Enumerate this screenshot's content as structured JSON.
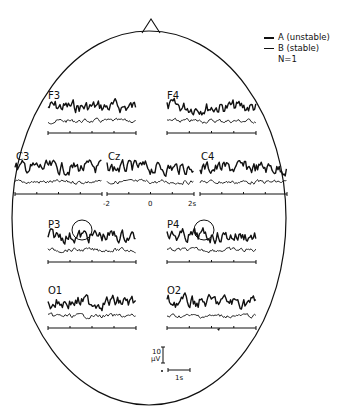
{
  "legend": {
    "series_a": "A (unstable)",
    "series_b": "B (stable)",
    "n_label": "N=1"
  },
  "electrodes": [
    {
      "id": "F3",
      "label": "F3",
      "x": 48,
      "y": 91,
      "trace_x0": 48,
      "trace_x1": 136,
      "has_circle": false
    },
    {
      "id": "F4",
      "label": "F4",
      "x": 167,
      "y": 91,
      "trace_x0": 167,
      "trace_x1": 256,
      "has_circle": false
    },
    {
      "id": "C3",
      "label": "C3",
      "x": 16,
      "y": 152,
      "trace_x0": 15,
      "trace_x1": 102,
      "has_circle": false
    },
    {
      "id": "Cz",
      "label": "Cz",
      "x": 108,
      "y": 152,
      "trace_x0": 107,
      "trace_x1": 194,
      "has_circle": false
    },
    {
      "id": "C4",
      "label": "C4",
      "x": 201,
      "y": 152,
      "trace_x0": 200,
      "trace_x1": 287,
      "has_circle": false
    },
    {
      "id": "P3",
      "label": "P3",
      "x": 48,
      "y": 220,
      "trace_x0": 48,
      "trace_x1": 136,
      "has_circle": true,
      "circle_cx": 82,
      "circle_cy": 230
    },
    {
      "id": "P4",
      "label": "P4",
      "x": 167,
      "y": 220,
      "trace_x0": 167,
      "trace_x1": 256,
      "has_circle": true,
      "circle_cx": 204,
      "circle_cy": 230
    },
    {
      "id": "O1",
      "label": "O1",
      "x": 48,
      "y": 286,
      "trace_x0": 48,
      "trace_x1": 136,
      "has_circle": false
    },
    {
      "id": "O2",
      "label": "O2",
      "x": 167,
      "y": 286,
      "trace_x0": 167,
      "trace_x1": 256,
      "has_circle": false
    }
  ],
  "time_axis": {
    "ticks": [
      "-2",
      "0",
      "2s"
    ]
  },
  "scale_bar": {
    "amplitude_value": "10",
    "amplitude_unit": "μV",
    "time_label": "1s"
  },
  "colors": {
    "ink": "#111111",
    "background": "#ffffff"
  }
}
